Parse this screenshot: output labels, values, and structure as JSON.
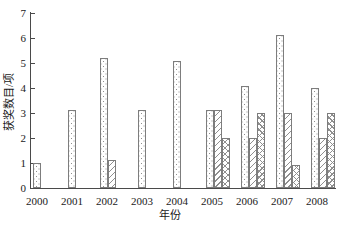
{
  "chart_data": {
    "type": "bar",
    "title": "",
    "xlabel": "年份",
    "ylabel": "获奖数目/项",
    "categories": [
      "2000",
      "2001",
      "2002",
      "2003",
      "2004",
      "2005",
      "2006",
      "2007",
      "2008"
    ],
    "series": [
      {
        "name": "stipple-series",
        "pattern": "stipple",
        "values": [
          1.0,
          3.1,
          5.2,
          3.1,
          5.1,
          3.1,
          4.1,
          6.1,
          4.0
        ]
      },
      {
        "name": "diagonal-series",
        "pattern": "diagonal-hatch",
        "values": [
          null,
          null,
          1.1,
          null,
          null,
          3.1,
          2.0,
          3.0,
          2.0
        ]
      },
      {
        "name": "crosshatch-series",
        "pattern": "crosshatch",
        "values": [
          null,
          null,
          null,
          null,
          null,
          2.0,
          3.0,
          0.9,
          3.0
        ]
      }
    ],
    "ylim": [
      0,
      7
    ],
    "yticks": [
      0,
      1,
      2,
      3,
      4,
      5,
      6,
      7
    ],
    "grid": false,
    "legend": "none",
    "colors": {
      "background": "#ffffff",
      "axis": "#4a4a4a",
      "text": "#1a1a1a",
      "bar_outline": "#7d7d7d",
      "bar_fill": "#ffffff",
      "pattern_ink": "#8f8f8f"
    }
  }
}
